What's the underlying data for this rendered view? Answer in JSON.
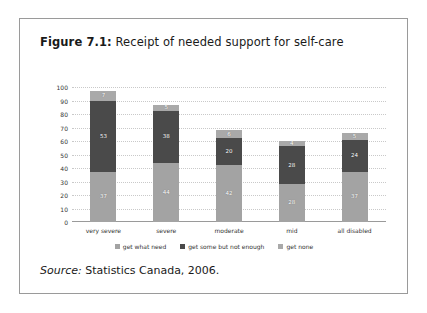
{
  "figure": {
    "caption_label": "Figure 7.1:",
    "caption_text": " Receipt of needed support for self-care",
    "source_label": "Source:",
    "source_text": " Statistics Canada, 2006."
  },
  "colors": {
    "series_get_what_need": "#a3a3a3",
    "series_get_some_but_not_enough": "#4a4a4a",
    "series_get_none": "#a9a9a9",
    "gridline": "#c9c9c9",
    "axis": "#9a9a9a",
    "frame": "#9a9a9a",
    "text": "#333333"
  },
  "chart_data": {
    "type": "bar",
    "stacked": true,
    "title": "Figure 7.1: Receipt of needed support for self-care",
    "xlabel": "",
    "ylabel": "",
    "ylim": [
      0,
      100
    ],
    "yticks": [
      0,
      10,
      20,
      30,
      40,
      50,
      60,
      70,
      80,
      90,
      100
    ],
    "ytick_labels": [
      "0",
      "10",
      "20",
      "30",
      "40",
      "50",
      "60",
      "70",
      "80",
      "90",
      "100"
    ],
    "grid": true,
    "legend_position": "bottom",
    "categories": [
      "very severe",
      "severe",
      "moderate",
      "mid",
      "all disabled"
    ],
    "series": [
      {
        "name": "get what need",
        "color": "#a3a3a3",
        "values": [
          37,
          44,
          42,
          28,
          37
        ],
        "labels": [
          "37",
          "44",
          "42",
          "28",
          "37"
        ]
      },
      {
        "name": "get some but not enough",
        "color": "#4a4a4a",
        "values": [
          53,
          38,
          20,
          28,
          24
        ],
        "labels": [
          "53",
          "38",
          "20",
          "28",
          "24"
        ]
      },
      {
        "name": "get none",
        "color": "#a9a9a9",
        "values": [
          7,
          5,
          6,
          4,
          5
        ],
        "labels": [
          "7",
          "5",
          "6",
          "4",
          "5"
        ]
      }
    ],
    "totals": [
      97,
      87,
      68,
      60,
      66
    ]
  }
}
